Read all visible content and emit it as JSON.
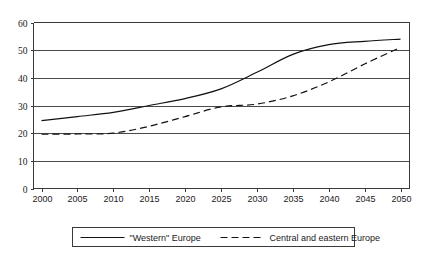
{
  "chart_data": {
    "type": "line",
    "title": "",
    "xlabel": "",
    "ylabel": "",
    "x": [
      2000,
      2005,
      2010,
      2015,
      2020,
      2025,
      2030,
      2035,
      2040,
      2045,
      2050
    ],
    "xticks": [
      "2000",
      "2005",
      "2010",
      "2015",
      "2020",
      "2025",
      "2030",
      "2035",
      "2040",
      "2045",
      "2050"
    ],
    "yticks": [
      "0",
      "10",
      "20",
      "30",
      "40",
      "50",
      "60"
    ],
    "ytickvalues": [
      0,
      10,
      20,
      30,
      40,
      50,
      60
    ],
    "ylim": [
      0,
      60
    ],
    "xlim": [
      2000,
      2050
    ],
    "grid": "horizontal",
    "legend_position": "bottom",
    "series": [
      {
        "name": "\"Western\" Europe",
        "style": "solid",
        "color": "#111111",
        "values": [
          24.5,
          26.0,
          27.5,
          30.0,
          32.5,
          36.0,
          42.0,
          48.5,
          52.0,
          53.2,
          54.0
        ]
      },
      {
        "name": "Central and eastern Europe",
        "style": "dashed",
        "color": "#111111",
        "values": [
          19.6,
          19.7,
          20.0,
          22.5,
          26.0,
          29.5,
          30.5,
          33.5,
          38.5,
          45.0,
          51.0
        ]
      }
    ]
  },
  "legend": {
    "entries": [
      {
        "label": "\"Western\" Europe",
        "style": "solid"
      },
      {
        "label": "Central and eastern Europe",
        "style": "dashed"
      }
    ]
  }
}
